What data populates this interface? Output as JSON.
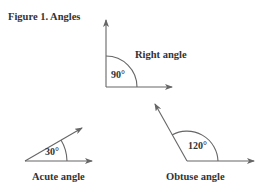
{
  "figure": {
    "title": "Figure 1.  Angles",
    "angles": [
      {
        "name": "Right angle",
        "degrees": "90°"
      },
      {
        "name": "Acute angle",
        "degrees": "30°"
      },
      {
        "name": "Obtuse angle",
        "degrees": "120°"
      }
    ]
  },
  "colors": {
    "line": "#666666",
    "text": "#333333"
  }
}
